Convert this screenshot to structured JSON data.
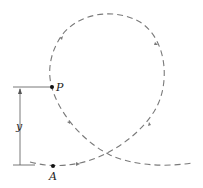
{
  "diagram": {
    "labels": {
      "point_p": "P",
      "point_a": "A",
      "height": "y"
    },
    "colors": {
      "path": "#7a7a7a",
      "line": "#555555",
      "point": "#111111"
    }
  }
}
